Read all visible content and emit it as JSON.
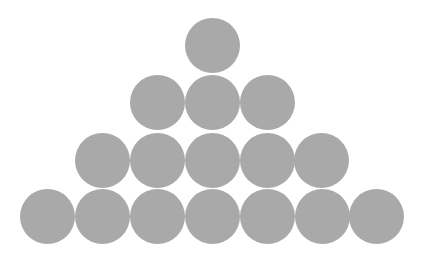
{
  "diagram": {
    "type": "triangular-pyramid-of-circles",
    "background": "#ffffff",
    "circle_color": "#a9a9a9",
    "circle_diameter": 55,
    "rows": [
      {
        "count": 1,
        "cy": 45,
        "cx": [
          212
        ]
      },
      {
        "count": 3,
        "cy": 102,
        "cx": [
          157,
          212,
          267
        ]
      },
      {
        "count": 5,
        "cy": 160,
        "cx": [
          102,
          157,
          212,
          267,
          321
        ]
      },
      {
        "count": 7,
        "cy": 216,
        "cx": [
          47,
          102,
          157,
          212,
          267,
          322,
          376
        ]
      }
    ],
    "total_circles": 16
  }
}
